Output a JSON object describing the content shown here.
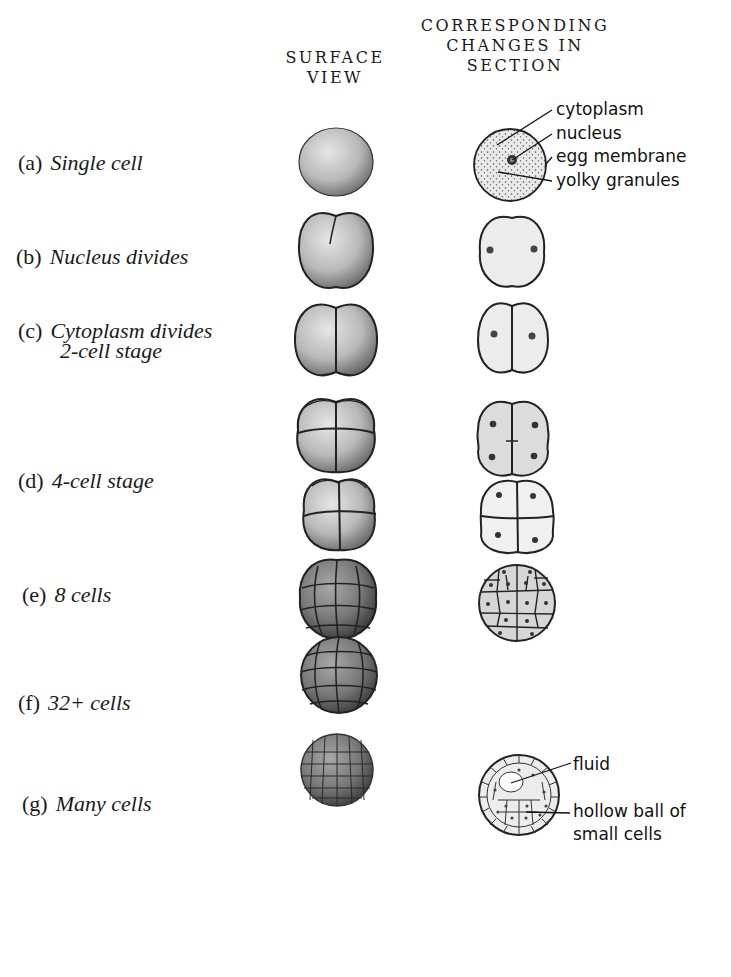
{
  "headers": {
    "surface_line1": "SURFACE",
    "surface_line2": "VIEW",
    "section_line1": "CORRESPONDING",
    "section_line2": "CHANGES IN",
    "section_line3": "SECTION"
  },
  "stages": [
    {
      "tag": "(a)",
      "label": "Single cell",
      "label2": ""
    },
    {
      "tag": "(b)",
      "label": "Nucleus divides",
      "label2": ""
    },
    {
      "tag": "(c)",
      "label": "Cytoplasm divides",
      "label2": "2-cell stage"
    },
    {
      "tag": "(d)",
      "label": "4-cell stage",
      "label2": ""
    },
    {
      "tag": "(e)",
      "label": "8 cells",
      "label2": ""
    },
    {
      "tag": "(f)",
      "label": "32+ cells",
      "label2": ""
    },
    {
      "tag": "(g)",
      "label": "Many cells",
      "label2": ""
    }
  ],
  "annotations": {
    "cytoplasm": "cytoplasm",
    "nucleus": "nucleus",
    "egg_membrane": "egg membrane",
    "yolky_granules": "yolky granules",
    "fluid": "fluid",
    "hollow_ball_line1": "hollow ball of",
    "hollow_ball_line2": "small cells"
  },
  "colors": {
    "ink": "#1a1a1a",
    "section_fill": "#ececec",
    "surface_fill": "#bdbdbd"
  }
}
